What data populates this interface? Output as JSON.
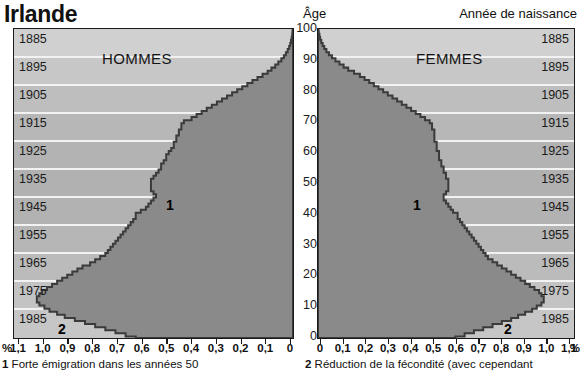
{
  "header": {
    "country": "Irlande",
    "age_axis_title": "Âge",
    "birthyear_axis_title": "Année de naissance"
  },
  "panels": {
    "men": {
      "label": "HOMMES"
    },
    "women": {
      "label": "FEMMES"
    }
  },
  "annotations": {
    "men_1": "1",
    "men_2": "2",
    "women_1": "1",
    "women_2": "2"
  },
  "footnotes": {
    "marker1": "1",
    "note1": "Forte émigration dans les années 50",
    "marker2": "2",
    "note2": "Réduction de la fécondité (avec cependant"
  },
  "axis": {
    "percent_symbol": "%",
    "birth_years": [
      "1885",
      "1895",
      "1905",
      "1915",
      "1925",
      "1935",
      "1945",
      "1955",
      "1965",
      "1975",
      "1985"
    ],
    "ages": [
      "100",
      "90",
      "80",
      "70",
      "60",
      "50",
      "40",
      "30",
      "20",
      "10",
      "0"
    ],
    "men_ticks": [
      "1,1",
      "1,0",
      "0,9",
      "0,8",
      "0,7",
      "0,6",
      "0,5",
      "0,4",
      "0,3",
      "0,2",
      "0,1",
      "0"
    ],
    "women_ticks": [
      "0",
      "0,1",
      "0,2",
      "0,3",
      "0,4",
      "0,5",
      "0,6",
      "0,7",
      "0,8",
      "0,9",
      "1,0",
      "1,1"
    ]
  },
  "colors": {
    "fill": "#8a8a8a",
    "outline": "#3b3b3b",
    "panel_background": "#c9c9c9",
    "gridline": "#f2f2f2",
    "frame": "#1a1a1a",
    "text": "#111111"
  },
  "chart_data": {
    "type": "area",
    "title": "Irlande",
    "subtype": "population-pyramid",
    "xlabel": "%",
    "ylabel": "Âge",
    "ylim": [
      0,
      100
    ],
    "xlim_men": [
      1.1,
      0
    ],
    "xlim_women": [
      0,
      1.1
    ],
    "grid": true,
    "legend_position": "none",
    "secondary_axis": {
      "label": "Année de naissance",
      "ticks": [
        "1885",
        "1895",
        "1905",
        "1915",
        "1925",
        "1935",
        "1945",
        "1955",
        "1965",
        "1975",
        "1985"
      ]
    },
    "ages": [
      0,
      1,
      2,
      3,
      4,
      5,
      6,
      7,
      8,
      9,
      10,
      11,
      12,
      13,
      14,
      15,
      16,
      17,
      18,
      19,
      20,
      21,
      22,
      23,
      24,
      25,
      26,
      27,
      28,
      29,
      30,
      31,
      32,
      33,
      34,
      35,
      36,
      37,
      38,
      39,
      40,
      41,
      42,
      43,
      44,
      45,
      46,
      47,
      48,
      49,
      50,
      51,
      52,
      53,
      54,
      55,
      56,
      57,
      58,
      59,
      60,
      61,
      62,
      63,
      64,
      65,
      66,
      67,
      68,
      69,
      70,
      71,
      72,
      73,
      74,
      75,
      76,
      77,
      78,
      79,
      80,
      81,
      82,
      83,
      84,
      85,
      86,
      87,
      88,
      89,
      90,
      91,
      92,
      93,
      94,
      95,
      96,
      97,
      98,
      99,
      100
    ],
    "series": [
      {
        "name": "HOMMES",
        "side": "left",
        "units": "% de la population totale",
        "values": [
          0.62,
          0.66,
          0.7,
          0.74,
          0.78,
          0.82,
          0.86,
          0.9,
          0.93,
          0.96,
          0.98,
          1.0,
          1.01,
          1.01,
          1.0,
          0.99,
          0.97,
          0.95,
          0.93,
          0.91,
          0.89,
          0.87,
          0.85,
          0.83,
          0.8,
          0.78,
          0.76,
          0.74,
          0.73,
          0.72,
          0.71,
          0.7,
          0.69,
          0.68,
          0.67,
          0.66,
          0.65,
          0.64,
          0.63,
          0.62,
          0.62,
          0.6,
          0.58,
          0.57,
          0.56,
          0.55,
          0.54,
          0.55,
          0.56,
          0.56,
          0.56,
          0.56,
          0.55,
          0.54,
          0.53,
          0.52,
          0.52,
          0.51,
          0.5,
          0.5,
          0.49,
          0.48,
          0.47,
          0.47,
          0.46,
          0.46,
          0.45,
          0.45,
          0.44,
          0.44,
          0.43,
          0.4,
          0.38,
          0.36,
          0.34,
          0.32,
          0.3,
          0.28,
          0.26,
          0.24,
          0.22,
          0.2,
          0.18,
          0.16,
          0.14,
          0.12,
          0.1,
          0.085,
          0.07,
          0.058,
          0.046,
          0.036,
          0.028,
          0.021,
          0.015,
          0.011,
          0.008,
          0.005,
          0.003,
          0.002,
          0.001
        ]
      },
      {
        "name": "FEMMES",
        "side": "right",
        "units": "% de la population totale",
        "values": [
          0.59,
          0.63,
          0.67,
          0.71,
          0.75,
          0.79,
          0.83,
          0.86,
          0.89,
          0.92,
          0.94,
          0.96,
          0.97,
          0.97,
          0.96,
          0.95,
          0.93,
          0.91,
          0.89,
          0.87,
          0.85,
          0.83,
          0.81,
          0.79,
          0.77,
          0.75,
          0.73,
          0.72,
          0.71,
          0.7,
          0.69,
          0.68,
          0.67,
          0.66,
          0.65,
          0.64,
          0.63,
          0.62,
          0.61,
          0.6,
          0.6,
          0.58,
          0.57,
          0.56,
          0.55,
          0.54,
          0.54,
          0.55,
          0.56,
          0.56,
          0.56,
          0.56,
          0.55,
          0.55,
          0.54,
          0.54,
          0.53,
          0.53,
          0.52,
          0.52,
          0.52,
          0.51,
          0.51,
          0.51,
          0.5,
          0.5,
          0.5,
          0.5,
          0.49,
          0.49,
          0.48,
          0.46,
          0.44,
          0.42,
          0.4,
          0.38,
          0.36,
          0.34,
          0.32,
          0.3,
          0.28,
          0.26,
          0.24,
          0.22,
          0.2,
          0.18,
          0.155,
          0.13,
          0.11,
          0.092,
          0.075,
          0.06,
          0.047,
          0.036,
          0.027,
          0.02,
          0.014,
          0.009,
          0.006,
          0.003,
          0.001
        ]
      }
    ],
    "notes": [
      {
        "marker": "1",
        "text": "Forte émigration dans les années 50",
        "applies_to_ages": [
          50,
          68
        ]
      },
      {
        "marker": "2",
        "text": "Réduction de la fécondité (avec cependant",
        "applies_to_ages": [
          0,
          4
        ]
      }
    ]
  }
}
